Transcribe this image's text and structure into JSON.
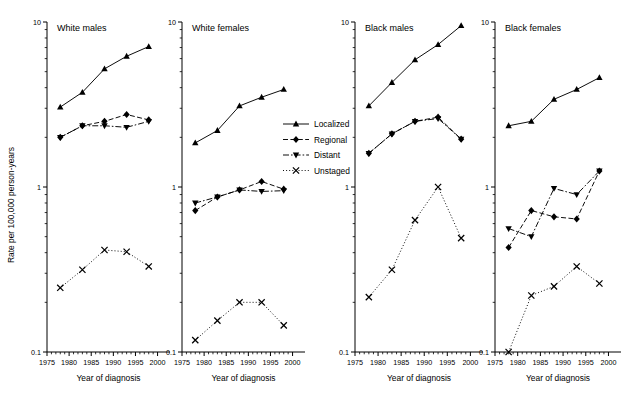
{
  "figure": {
    "ylabel": "Rate per 100,000 person-years",
    "xlabel": "Year of diagnosis",
    "y_ticks_major": [
      "10",
      "1",
      "0.1"
    ],
    "x_ticks_major": [
      "1975",
      "1980",
      "1985",
      "1990",
      "1995",
      "2000"
    ],
    "scale": "log10",
    "ylim": [
      0.1,
      10
    ],
    "xlim": [
      1975,
      2001
    ]
  },
  "legend": {
    "position": "center-between-panel2-and-panel3",
    "entries": [
      {
        "label": "Localized",
        "marker": "triangle-up",
        "line": "solid",
        "color": "#000000"
      },
      {
        "label": "Regional",
        "marker": "diamond",
        "line": "dashed",
        "color": "#000000"
      },
      {
        "label": "Distant",
        "marker": "triangle-down",
        "line": "dash-dot",
        "color": "#000000"
      },
      {
        "label": "Unstaged",
        "marker": "cross",
        "line": "dotted",
        "color": "#000000"
      }
    ]
  },
  "chart_data": {
    "type": "line",
    "title": "",
    "xlabel": "Year of diagnosis",
    "ylabel": "Rate per 100,000 person-years",
    "ylim": [
      0.1,
      10
    ],
    "xlim": [
      1975,
      2001
    ],
    "yscale": "log",
    "grid": false,
    "legend_position": "center",
    "panels": [
      {
        "name": "White males",
        "x": [
          1978,
          1983,
          1988,
          1993,
          1998
        ],
        "series": [
          {
            "name": "Localized",
            "values": [
              3.05,
              3.75,
              5.2,
              6.2,
              7.1
            ]
          },
          {
            "name": "Regional",
            "values": [
              2.0,
              2.35,
              2.5,
              2.75,
              2.55
            ]
          },
          {
            "name": "Distant",
            "values": [
              2.0,
              2.35,
              2.35,
              2.3,
              2.5
            ]
          },
          {
            "name": "Unstaged",
            "values": [
              0.245,
              0.315,
              0.415,
              0.405,
              0.33
            ]
          }
        ]
      },
      {
        "name": "White females",
        "x": [
          1978,
          1983,
          1988,
          1993,
          1998
        ],
        "series": [
          {
            "name": "Localized",
            "values": [
              1.85,
              2.2,
              3.1,
              3.5,
              3.9
            ]
          },
          {
            "name": "Regional",
            "values": [
              0.72,
              0.87,
              0.96,
              1.08,
              0.97
            ]
          },
          {
            "name": "Distant",
            "values": [
              0.8,
              0.87,
              0.96,
              0.94,
              0.95
            ]
          },
          {
            "name": "Unstaged",
            "values": [
              0.118,
              0.155,
              0.2,
              0.2,
              0.145
            ]
          }
        ]
      },
      {
        "name": "Black males",
        "x": [
          1978,
          1983,
          1988,
          1993,
          1998
        ],
        "series": [
          {
            "name": "Localized",
            "values": [
              3.1,
              4.3,
              5.9,
              7.3,
              9.5
            ]
          },
          {
            "name": "Regional",
            "values": [
              1.6,
              2.1,
              2.5,
              2.65,
              1.95
            ]
          },
          {
            "name": "Distant",
            "values": [
              1.6,
              2.1,
              2.5,
              2.6,
              1.95
            ]
          },
          {
            "name": "Unstaged",
            "values": [
              0.215,
              0.315,
              0.63,
              1.0,
              0.49
            ]
          }
        ]
      },
      {
        "name": "Black females",
        "x": [
          1978,
          1983,
          1988,
          1993,
          1998
        ],
        "series": [
          {
            "name": "Localized",
            "values": [
              2.35,
              2.5,
              3.4,
              3.9,
              4.6
            ]
          },
          {
            "name": "Regional",
            "values": [
              0.43,
              0.72,
              0.66,
              0.64,
              1.25
            ]
          },
          {
            "name": "Distant",
            "values": [
              0.56,
              0.5,
              0.98,
              0.9,
              1.25
            ]
          },
          {
            "name": "Unstaged",
            "values": [
              0.1,
              0.22,
              0.25,
              0.33,
              0.26
            ]
          }
        ]
      }
    ]
  }
}
